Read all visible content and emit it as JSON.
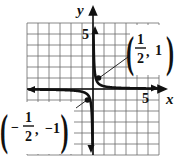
{
  "chart_data": {
    "type": "line",
    "title": "",
    "function": "y = 1/(4x)",
    "xlabel": "x",
    "ylabel": "y",
    "xlim": [
      -6,
      6
    ],
    "ylim": [
      -6,
      6
    ],
    "grid": true,
    "tick_labels": {
      "x": "5",
      "y": "5"
    },
    "series": [
      {
        "name": "branch-right",
        "x": [
          0.05,
          0.1,
          0.25,
          0.5,
          1,
          2,
          3,
          4,
          5,
          6
        ],
        "y": [
          5,
          2.5,
          1,
          0.5,
          0.25,
          0.125,
          0.083,
          0.0625,
          0.05,
          0.042
        ]
      },
      {
        "name": "branch-left",
        "x": [
          -6,
          -5,
          -4,
          -3,
          -2,
          -1,
          -0.5,
          -0.25,
          -0.1,
          -0.05
        ],
        "y": [
          -0.042,
          -0.05,
          -0.0625,
          -0.083,
          -0.125,
          -0.25,
          -0.5,
          -1,
          -2.5,
          -5
        ]
      }
    ],
    "annotations": [
      {
        "point": [
          0.5,
          1
        ],
        "label_num": "1",
        "label_den": "2",
        "label_y": "1",
        "text": "(1/2, 1)"
      },
      {
        "point": [
          -0.5,
          -1
        ],
        "label_num": "1",
        "label_den": "2",
        "label_y": "-1",
        "text": "(-1/2, -1)"
      }
    ]
  },
  "labels": {
    "x_axis": "x",
    "y_axis": "y",
    "x_tick": "5",
    "y_tick": "5",
    "ann1_num": "1",
    "ann1_den": "2",
    "ann1_y": "1",
    "ann2_minus": "−",
    "ann2_num": "1",
    "ann2_den": "2",
    "ann2_y": "−1"
  },
  "colors": {
    "grid": "#555555",
    "curve": "#111111",
    "axis": "#111111"
  }
}
